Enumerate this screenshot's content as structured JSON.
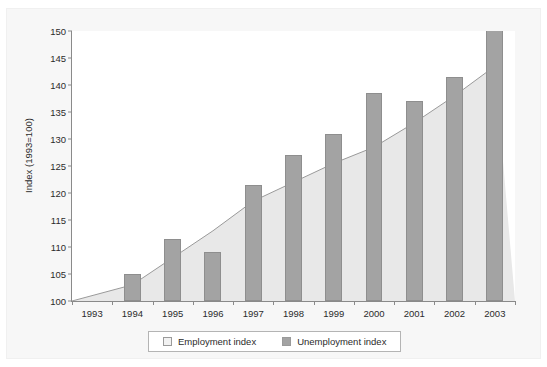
{
  "caption": "",
  "legend": {
    "position": "bottom-center",
    "items": [
      {
        "label": "Employment index",
        "swatch": "employment-swatch",
        "color": "#f2f2f2"
      },
      {
        "label": "Unemployment index",
        "swatch": "unemployment-swatch",
        "color": "#a3a3a3"
      }
    ]
  },
  "colors": {
    "bar_fill": "#a3a3a3",
    "bar_stroke": "#8e8e8e",
    "area_fill": "#e8e8e8",
    "area_stroke": "#9a9a9a",
    "axis": "#8a8a8a",
    "panel_background": "#f7f7f7",
    "plot_background": "#ffffff"
  },
  "chart_data": {
    "type": "bar",
    "title": "",
    "xlabel": "",
    "ylabel": "Index (1993=100)",
    "categories": [
      "1993",
      "1994",
      "1995",
      "1996",
      "1997",
      "1998",
      "1999",
      "2000",
      "2001",
      "2002",
      "2003"
    ],
    "ylim": [
      100,
      150
    ],
    "yticks": [
      100,
      105,
      110,
      115,
      120,
      125,
      130,
      135,
      140,
      145,
      150
    ],
    "grid": false,
    "series": [
      {
        "name": "Employment index",
        "type": "area",
        "values": [
          100,
          103,
          108,
          113,
          118.5,
          122,
          125.5,
          128.5,
          133,
          138,
          143.5
        ]
      },
      {
        "name": "Unemployment index",
        "type": "bar",
        "values": [
          100,
          105,
          111.5,
          109,
          121.5,
          127,
          131,
          138.5,
          137,
          141.5,
          151
        ]
      }
    ]
  }
}
